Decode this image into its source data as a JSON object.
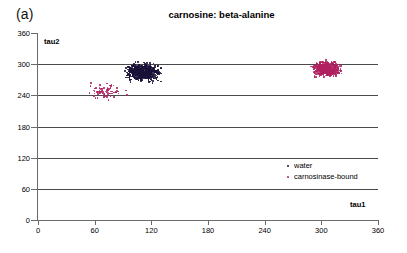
{
  "panel": {
    "label": "(a)"
  },
  "chart_data": {
    "type": "scatter",
    "title": "carnosine: beta-alanine",
    "xlabel": "tau1",
    "ylabel": "tau2",
    "xlim": [
      0,
      360
    ],
    "ylim": [
      0,
      360
    ],
    "xticks": [
      0,
      60,
      120,
      180,
      240,
      300,
      360
    ],
    "yticks": [
      0,
      60,
      120,
      180,
      240,
      300,
      360
    ],
    "grid": "horizontal",
    "gridlines_at": [
      60,
      120,
      180,
      240,
      300
    ],
    "legend_position": "inside-right",
    "series": [
      {
        "name": "water",
        "color": "#1a1038",
        "marker": "dot",
        "cluster_center": [
          110,
          286
        ],
        "cluster_spread": [
          13,
          13
        ],
        "n_points": 620
      },
      {
        "name": "carnosinase-bound",
        "color": "#b02060",
        "marker": "dot",
        "cluster_center": [
          305,
          292
        ],
        "cluster_spread": [
          11,
          11
        ],
        "n_points": 470,
        "outlier_cluster_center": [
          70,
          250
        ],
        "outlier_spread": [
          16,
          11
        ],
        "n_outliers": 75
      }
    ]
  },
  "legend": {
    "items": [
      {
        "label": "water",
        "color": "#1a1038"
      },
      {
        "label": "carnosinase-bound",
        "color": "#b02060"
      }
    ]
  }
}
